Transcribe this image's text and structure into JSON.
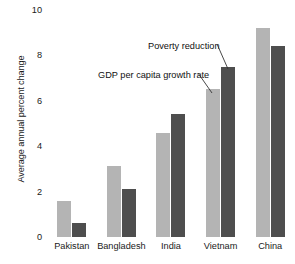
{
  "chart_data": {
    "type": "bar",
    "title": "",
    "xlabel": "",
    "ylabel": "Average annual percent change",
    "categories": [
      "Pakistan",
      "Bangladesh",
      "India",
      "Vietnam",
      "China"
    ],
    "series": [
      {
        "name": "GDP per capita growth rate",
        "color": "#b4b4b4",
        "values": [
          1.6,
          3.15,
          4.6,
          6.5,
          9.2
        ]
      },
      {
        "name": "Poverty reduction",
        "color": "#4e4e4e",
        "values": [
          0.6,
          2.1,
          5.4,
          7.5,
          8.4
        ]
      }
    ],
    "ylim": [
      0,
      10
    ],
    "yticks": [
      "0",
      "2",
      "4",
      "6",
      "8",
      "10"
    ],
    "grid": false,
    "legend": "none",
    "annotations": [
      {
        "text": "Poverty reduction",
        "target_series": "Poverty reduction",
        "target_category": "Vietnam"
      },
      {
        "text": "GDP per capita growth rate",
        "target_series": "GDP per capita growth rate",
        "target_category": "Vietnam"
      }
    ]
  }
}
